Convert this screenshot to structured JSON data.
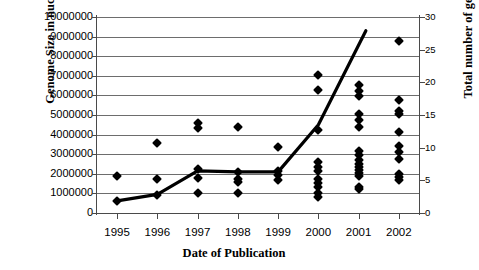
{
  "chart_data": {
    "type": "scatter",
    "title": "",
    "xlabel": "Date of Publication",
    "ylabel": "Genome Size in nucleotides",
    "ylabel_right": "Total number of genomes",
    "grid": true,
    "legend": "none",
    "xlim": [
      1994.5,
      2002.5
    ],
    "ylim": [
      0,
      10000000
    ],
    "ylim_right": [
      0,
      30
    ],
    "xticks": [
      "1995",
      "1996",
      "1997",
      "1998",
      "1999",
      "2000",
      "2001",
      "2002"
    ],
    "yticks_left": [
      "0",
      "1000000",
      "2000000",
      "3000000",
      "4000000",
      "5000000",
      "6000000",
      "7000000",
      "8000000",
      "9000000",
      "10000000"
    ],
    "yticks_right": [
      "0",
      "5",
      "10",
      "15",
      "20",
      "25",
      "30"
    ],
    "marker_shape": "diamond",
    "marker_color": "#000000",
    "trendline_color": "#000000",
    "series": [
      {
        "name": "Genome size of published genomes",
        "axis": "left",
        "points": [
          {
            "x": 1995,
            "y": 1900000
          },
          {
            "x": 1995,
            "y": 600000
          },
          {
            "x": 1996,
            "y": 3550000
          },
          {
            "x": 1996,
            "y": 1750000
          },
          {
            "x": 1996,
            "y": 920000
          },
          {
            "x": 1997,
            "y": 4600000
          },
          {
            "x": 1997,
            "y": 4350000
          },
          {
            "x": 1997,
            "y": 2250000
          },
          {
            "x": 1997,
            "y": 1800000
          },
          {
            "x": 1997,
            "y": 1000000
          },
          {
            "x": 1998,
            "y": 4400000
          },
          {
            "x": 1998,
            "y": 2100000
          },
          {
            "x": 1998,
            "y": 1750000
          },
          {
            "x": 1998,
            "y": 1580000
          },
          {
            "x": 1998,
            "y": 1000000
          },
          {
            "x": 1999,
            "y": 3350000
          },
          {
            "x": 1999,
            "y": 2150000
          },
          {
            "x": 1999,
            "y": 1950000
          },
          {
            "x": 1999,
            "y": 1700000
          },
          {
            "x": 2000,
            "y": 7050000
          },
          {
            "x": 2000,
            "y": 6300000
          },
          {
            "x": 2000,
            "y": 4250000
          },
          {
            "x": 2000,
            "y": 2600000
          },
          {
            "x": 2000,
            "y": 2350000
          },
          {
            "x": 2000,
            "y": 2150000
          },
          {
            "x": 2000,
            "y": 1750000
          },
          {
            "x": 2000,
            "y": 1550000
          },
          {
            "x": 2000,
            "y": 1350000
          },
          {
            "x": 2000,
            "y": 1000000
          },
          {
            "x": 2000,
            "y": 800000
          },
          {
            "x": 2001,
            "y": 6550000
          },
          {
            "x": 2001,
            "y": 6250000
          },
          {
            "x": 2001,
            "y": 5950000
          },
          {
            "x": 2001,
            "y": 5050000
          },
          {
            "x": 2001,
            "y": 4750000
          },
          {
            "x": 2001,
            "y": 4400000
          },
          {
            "x": 2001,
            "y": 3150000
          },
          {
            "x": 2001,
            "y": 2950000
          },
          {
            "x": 2001,
            "y": 2700000
          },
          {
            "x": 2001,
            "y": 2500000
          },
          {
            "x": 2001,
            "y": 2350000
          },
          {
            "x": 2001,
            "y": 2200000
          },
          {
            "x": 2001,
            "y": 2050000
          },
          {
            "x": 2001,
            "y": 1900000
          },
          {
            "x": 2001,
            "y": 1350000
          },
          {
            "x": 2001,
            "y": 1200000
          },
          {
            "x": 2002,
            "y": 8800000
          },
          {
            "x": 2002,
            "y": 5750000
          },
          {
            "x": 2002,
            "y": 5200000
          },
          {
            "x": 2002,
            "y": 5050000
          },
          {
            "x": 2002,
            "y": 4150000
          },
          {
            "x": 2002,
            "y": 3400000
          },
          {
            "x": 2002,
            "y": 3100000
          },
          {
            "x": 2002,
            "y": 2750000
          },
          {
            "x": 2002,
            "y": 2000000
          },
          {
            "x": 2002,
            "y": 1850000
          },
          {
            "x": 2002,
            "y": 1700000
          }
        ]
      },
      {
        "name": "Total number of genomes",
        "axis": "left",
        "type": "line",
        "points": [
          {
            "x": 1995,
            "y": 620000
          },
          {
            "x": 1996,
            "y": 950000
          },
          {
            "x": 1997,
            "y": 2150000
          },
          {
            "x": 1998,
            "y": 2100000
          },
          {
            "x": 1999,
            "y": 2100000
          },
          {
            "x": 2000,
            "y": 4500000
          },
          {
            "x": 2001.18,
            "y": 9300000
          }
        ]
      }
    ]
  }
}
